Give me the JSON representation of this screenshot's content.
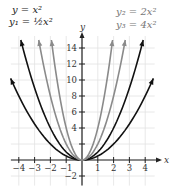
{
  "chart_data": {
    "type": "line",
    "title": "",
    "xlabel": "x",
    "ylabel": "y",
    "xlim": [
      -4.5,
      4.5
    ],
    "ylim": [
      -3,
      16
    ],
    "grid": true,
    "x_ticks": [
      -4,
      -3,
      -2,
      -1,
      1,
      2,
      3,
      4
    ],
    "y_ticks": [
      -2,
      2,
      4,
      6,
      8,
      10,
      12,
      14
    ],
    "y_tick_labels": [
      "-2",
      "",
      "4",
      "6",
      "8",
      "10",
      "12",
      "14"
    ],
    "series": [
      {
        "name": "y = x^2",
        "label_html": "y = x²",
        "coef": 1,
        "color": "#111111"
      },
      {
        "name": "y1 = 1/2 x^2",
        "label_html": "y₁ = ½x²",
        "coef": 0.5,
        "color": "#111111"
      },
      {
        "name": "y2 = 2x^2",
        "label_html": "y₂ = 2x²",
        "coef": 2,
        "color": "#8a8a8a"
      },
      {
        "name": "y3 = 4x^2",
        "label_html": "y₃ = 4x²",
        "coef": 4,
        "color": "#8a8a8a"
      }
    ],
    "legend": {
      "left": [
        "y = x²",
        "y₁ = ½x²"
      ],
      "right": [
        "y₂ = 2x²",
        "y₃ = 4x²"
      ]
    }
  },
  "labels": {
    "eq_y": "y = x²",
    "eq_y1": "y₁ = ½x²",
    "eq_y2": "y₂ = 2x²",
    "eq_y3": "y₃ = 4x²",
    "x_axis": "x",
    "y_axis": "y"
  }
}
